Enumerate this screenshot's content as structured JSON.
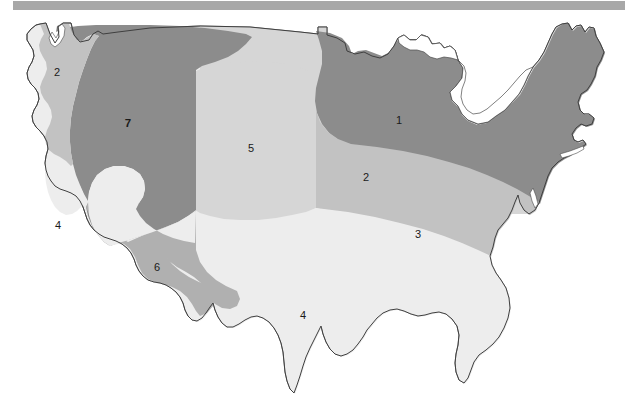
{
  "page": {
    "background_color": "#ffffff"
  },
  "top_band": {
    "name": "header-band",
    "color": "#a8a8a8"
  },
  "map": {
    "name": "us-climate-zone-map",
    "outline_color": "#3f3f3f",
    "zones": [
      {
        "id": "zone-1",
        "label": "1",
        "color": "#8c8c8c",
        "bold": false,
        "label_x": 399,
        "label_y": 111,
        "description": "Northern tier / upper Midwest and northern New England"
      },
      {
        "id": "zone-2-nw",
        "label": "2",
        "color": "#c2c2c2",
        "bold": false,
        "label_x": 57,
        "label_y": 63,
        "description": "Pacific Northwest coastal strip"
      },
      {
        "id": "zone-2-mid",
        "label": "2",
        "color": "#c2c2c2",
        "bold": false,
        "label_x": 366,
        "label_y": 168,
        "description": "Mid-latitude band across the Midwest and Northeast coast"
      },
      {
        "id": "zone-3",
        "label": "3",
        "color": "#ededed",
        "bold": false,
        "label_x": 418,
        "label_y": 225,
        "description": "Southeastern interior band"
      },
      {
        "id": "zone-4-ca",
        "label": "4",
        "color": "#ededed",
        "bold": false,
        "label_x": 58,
        "label_y": 216,
        "description": "California coastal zone"
      },
      {
        "id": "zone-4-south",
        "label": "4",
        "color": "#ededed",
        "bold": false,
        "label_x": 303,
        "label_y": 306,
        "description": "Gulf Coast and deep south"
      },
      {
        "id": "zone-5",
        "label": "5",
        "color": "#d6d6d6",
        "bold": false,
        "label_x": 251,
        "label_y": 139,
        "description": "Great Plains / Rocky Mountain eastern slope"
      },
      {
        "id": "zone-6",
        "label": "6",
        "color": "#b0b0b0",
        "bold": false,
        "label_x": 157,
        "label_y": 258,
        "description": "Desert Southwest"
      },
      {
        "id": "zone-7",
        "label": "7",
        "color": "#8c8c8c",
        "bold": true,
        "label_x": 128,
        "label_y": 114,
        "description": "Interior West / Northern Rockies"
      }
    ],
    "palette": {
      "darkest": "#8c8c8c",
      "dark": "#b0b0b0",
      "medium": "#c2c2c2",
      "light": "#d6d6d6",
      "lightest": "#ededed"
    }
  }
}
